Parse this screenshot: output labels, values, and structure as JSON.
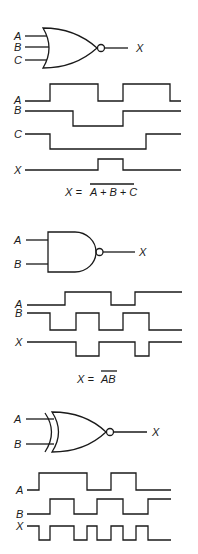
{
  "sections": [
    {
      "gate": {
        "type": "NOR",
        "inputs": [
          "A",
          "B",
          "C"
        ],
        "output": "X"
      },
      "timing": {
        "signals": [
          {
            "name": "A",
            "levels": [
              0,
              1,
              0,
              1,
              0
            ]
          },
          {
            "name": "B",
            "levels": [
              1,
              0,
              1
            ]
          },
          {
            "name": "C",
            "levels": [
              1,
              0,
              1
            ]
          },
          {
            "name": "X",
            "levels": [
              0,
              1,
              0
            ]
          }
        ]
      },
      "equation": {
        "lhs": "X =",
        "rhs": "A + B + C",
        "overbar": true
      }
    },
    {
      "gate": {
        "type": "NAND",
        "inputs": [
          "A",
          "B"
        ],
        "output": "X"
      },
      "timing": {
        "signals": [
          {
            "name": "A",
            "levels": [
              0,
              1,
              0,
              1
            ]
          },
          {
            "name": "B",
            "levels": [
              1,
              0,
              1,
              0,
              1,
              0
            ]
          },
          {
            "name": "X",
            "levels": [
              1,
              0,
              1,
              0,
              1
            ]
          }
        ]
      },
      "equation": {
        "lhs": "X =",
        "rhs": "AB",
        "overbar": true
      }
    },
    {
      "gate": {
        "type": "XNOR",
        "inputs": [
          "A",
          "B"
        ],
        "output": "X"
      },
      "timing": {
        "signals": [
          {
            "name": "A",
            "levels": [
              0,
              1,
              0,
              1,
              0
            ]
          },
          {
            "name": "B",
            "levels": [
              0,
              1,
              0,
              1,
              0,
              1
            ]
          },
          {
            "name": "X",
            "levels": [
              1,
              0,
              1,
              0,
              1,
              0,
              1,
              0,
              1,
              0
            ]
          }
        ]
      }
    }
  ]
}
